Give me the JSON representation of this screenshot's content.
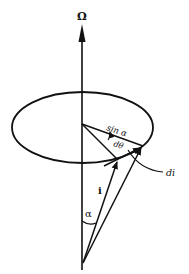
{
  "diagram": {
    "type": "precession-vector-diagram",
    "colors": {
      "ink": "#111111",
      "background": "#ffffff"
    },
    "labels": {
      "axis": "Ω",
      "radius": "sin α",
      "angle_increment": "dθ",
      "vector": "i",
      "vector_increment": "di",
      "cone_angle": "α"
    },
    "elements": [
      {
        "id": "omega-axis",
        "kind": "arrow",
        "from": [
          82,
          270
        ],
        "to": [
          82,
          26
        ],
        "label": "Ω"
      },
      {
        "id": "precession-circle",
        "kind": "ellipse",
        "cx": 82.5,
        "cy": 127.5,
        "rx": 70.5,
        "ry": 35.5
      },
      {
        "id": "radius-sin-alpha",
        "kind": "line",
        "from": [
          82,
          124
        ],
        "to": [
          143,
          146
        ],
        "label": "sin α"
      },
      {
        "id": "radius-lower",
        "kind": "line",
        "from": [
          82,
          124
        ],
        "to": [
          118,
          160
        ]
      },
      {
        "id": "dtheta-arc",
        "kind": "arc-arrow",
        "label": "dθ"
      },
      {
        "id": "vector-i",
        "kind": "arrow",
        "from": [
          83,
          263
        ],
        "to": [
          118,
          160
        ],
        "label": "i"
      },
      {
        "id": "vector-i-plus-di",
        "kind": "arrow",
        "from": [
          83,
          263
        ],
        "to": [
          143,
          146
        ]
      },
      {
        "id": "vector-di",
        "kind": "arrow",
        "from": [
          118,
          160
        ],
        "to": [
          142,
          146
        ],
        "label": "di"
      },
      {
        "id": "alpha-arc",
        "kind": "arc",
        "label": "α"
      }
    ]
  }
}
